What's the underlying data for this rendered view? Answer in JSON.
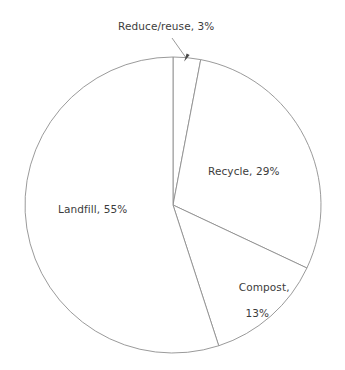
{
  "chart_data": {
    "type": "pie",
    "title": "",
    "subtitle": "",
    "xlabel": "",
    "ylabel": "",
    "legend": "none",
    "grid": false,
    "start_angle_deg": 90,
    "direction": "clockwise",
    "categories": [
      "Reduce/reuse",
      "Recycle",
      "Compost",
      "Landfill"
    ],
    "values": [
      3,
      29,
      13,
      55
    ],
    "unit": "%",
    "labels": [
      "Reduce/reuse, 3%",
      "Recycle, 29%",
      "Compost, 13%",
      "Landfill, 55%"
    ],
    "annotations": [
      {
        "text": "Reduce/reuse, 3%",
        "points_to": "reduce-reuse-slice",
        "has_leader_line": true,
        "has_arrowhead": true
      }
    ],
    "slice_fill_color": "#ffffff",
    "slice_stroke_color": "#8e8e8e",
    "text_color": "#3c3c3c",
    "background_color": "#ffffff"
  },
  "labels": {
    "reduce": "Reduce/reuse, 3%",
    "recycle": "Recycle, 29%",
    "landfill": "Landfill, 55%",
    "compost_name": "Compost,",
    "compost_value": "13%"
  },
  "geometry": {
    "center_x": 173,
    "center_y": 205,
    "radius": 148
  }
}
